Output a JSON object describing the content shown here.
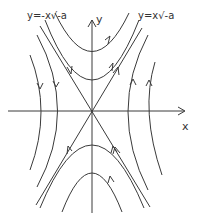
{
  "diagram": {
    "type": "phase-portrait-saddle",
    "axes": {
      "x_label": "x",
      "y_label": "y"
    },
    "asymptotes": [
      {
        "label": "y=-x√-a",
        "direction": "inbound"
      },
      {
        "label": "y=x√-a",
        "direction": "outbound"
      }
    ],
    "trajectory_families": [
      {
        "region": "top",
        "count": 2,
        "flow": "rightward-up"
      },
      {
        "region": "bottom",
        "count": 2,
        "flow": "leftward-up"
      },
      {
        "region": "left",
        "count": 2,
        "flow": "down"
      },
      {
        "region": "right",
        "count": 2,
        "flow": "up"
      }
    ],
    "colors": {
      "stroke": "#3a3a3a",
      "background": "#ffffff"
    }
  }
}
